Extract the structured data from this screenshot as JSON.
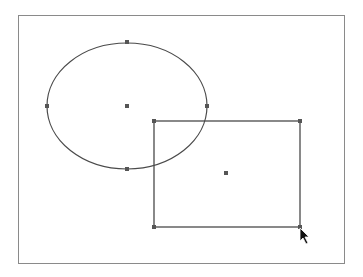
{
  "canvas": {
    "frame": {
      "x": 18,
      "y": 15,
      "width": 327,
      "height": 249,
      "border_color": "#8a8a8a"
    },
    "stroke_color": "#4a4a4a",
    "handle_color": "#555555",
    "handle_size": 4
  },
  "shapes": [
    {
      "type": "ellipse",
      "name": "ellipse-shape",
      "cx": 127,
      "cy": 106,
      "rx": 80,
      "ry": 63,
      "handles": [
        {
          "name": "ellipse-handle-top",
          "x": 127,
          "y": 42
        },
        {
          "name": "ellipse-handle-left",
          "x": 47,
          "y": 106
        },
        {
          "name": "ellipse-handle-right",
          "x": 207,
          "y": 106
        },
        {
          "name": "ellipse-handle-bottom",
          "x": 127,
          "y": 169
        },
        {
          "name": "ellipse-center-handle",
          "x": 127,
          "y": 106
        }
      ]
    },
    {
      "type": "rectangle",
      "name": "rectangle-shape",
      "x": 154,
      "y": 121,
      "width": 146,
      "height": 106,
      "handles": [
        {
          "name": "rect-handle-top-left",
          "x": 154,
          "y": 121
        },
        {
          "name": "rect-handle-top-right",
          "x": 300,
          "y": 121
        },
        {
          "name": "rect-handle-bottom-left",
          "x": 154,
          "y": 227
        },
        {
          "name": "rect-handle-bottom-right",
          "x": 300,
          "y": 227
        },
        {
          "name": "rect-center-handle",
          "x": 226,
          "y": 173
        }
      ]
    }
  ],
  "cursor": {
    "type": "arrow",
    "x": 300,
    "y": 228
  }
}
